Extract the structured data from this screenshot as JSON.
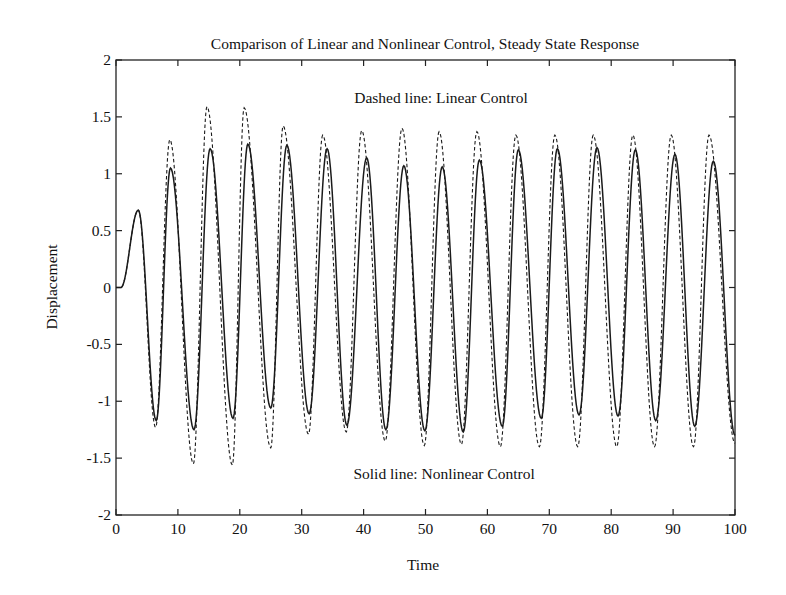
{
  "chart_data": {
    "type": "line",
    "title": "Comparison of Linear and Nonlinear Control, Steady State Response",
    "xlabel": "Time",
    "ylabel": "Displacement",
    "xlim": [
      0,
      100
    ],
    "ylim": [
      -2,
      2
    ],
    "xticks": [
      0,
      10,
      20,
      30,
      40,
      50,
      60,
      70,
      80,
      90,
      100
    ],
    "yticks": [
      -2,
      -1.5,
      -1,
      -0.5,
      0,
      0.5,
      1,
      1.5,
      2
    ],
    "ytick_labels": [
      "-2",
      "-1.5",
      "-1",
      "-0.5",
      "0",
      "0.5",
      "1",
      "1.5",
      "2"
    ],
    "grid": false,
    "annotations": [
      {
        "text": "Dashed line: Linear Control",
        "x": 52.5,
        "y": 1.62
      },
      {
        "text": "Solid line: Nonlinear Control",
        "x": 53,
        "y": -1.68
      }
    ],
    "series": [
      {
        "name": "Linear Control",
        "style": "dashed",
        "extrema": [
          [
            0,
            0
          ],
          [
            0.8,
            0
          ],
          [
            3.6,
            0.68
          ],
          [
            6.4,
            -1.23
          ],
          [
            8.7,
            1.3
          ],
          [
            12.5,
            -1.55
          ],
          [
            14.7,
            1.59
          ],
          [
            18.8,
            -1.56
          ],
          [
            20.7,
            1.58
          ],
          [
            25.0,
            -1.41
          ],
          [
            27.0,
            1.42
          ],
          [
            31.1,
            -1.29
          ],
          [
            33.4,
            1.34
          ],
          [
            37.2,
            -1.27
          ],
          [
            39.7,
            1.38
          ],
          [
            43.5,
            -1.35
          ],
          [
            46.2,
            1.4
          ],
          [
            49.8,
            -1.39
          ],
          [
            52.2,
            1.37
          ],
          [
            55.8,
            -1.38
          ],
          [
            58.3,
            1.37
          ],
          [
            62.1,
            -1.4
          ],
          [
            64.6,
            1.34
          ],
          [
            68.4,
            -1.4
          ],
          [
            70.9,
            1.34
          ],
          [
            74.6,
            -1.4
          ],
          [
            77.1,
            1.34
          ],
          [
            80.9,
            -1.4
          ],
          [
            83.5,
            1.34
          ],
          [
            87.0,
            -1.4
          ],
          [
            89.7,
            1.34
          ],
          [
            93.3,
            -1.4
          ],
          [
            95.8,
            1.34
          ],
          [
            100,
            -1.37
          ]
        ]
      },
      {
        "name": "Nonlinear Control",
        "style": "solid",
        "extrema": [
          [
            0,
            0
          ],
          [
            0.8,
            0
          ],
          [
            3.6,
            0.68
          ],
          [
            6.5,
            -1.17
          ],
          [
            8.8,
            1.05
          ],
          [
            12.6,
            -1.25
          ],
          [
            15.2,
            1.22
          ],
          [
            18.9,
            -1.15
          ],
          [
            21.3,
            1.26
          ],
          [
            25.0,
            -1.06
          ],
          [
            27.6,
            1.25
          ],
          [
            31.2,
            -1.11
          ],
          [
            34.1,
            1.22
          ],
          [
            37.3,
            -1.21
          ],
          [
            40.5,
            1.14
          ],
          [
            43.6,
            -1.25
          ],
          [
            46.5,
            1.07
          ],
          [
            49.9,
            -1.26
          ],
          [
            52.7,
            1.06
          ],
          [
            56.1,
            -1.27
          ],
          [
            58.7,
            1.12
          ],
          [
            62.4,
            -1.22
          ],
          [
            65.0,
            1.21
          ],
          [
            68.7,
            -1.15
          ],
          [
            71.3,
            1.22
          ],
          [
            74.8,
            -1.12
          ],
          [
            77.7,
            1.23
          ],
          [
            81.1,
            -1.13
          ],
          [
            83.9,
            1.21
          ],
          [
            87.2,
            -1.17
          ],
          [
            90.3,
            1.17
          ],
          [
            93.5,
            -1.22
          ],
          [
            96.5,
            1.11
          ],
          [
            100,
            -1.3
          ]
        ]
      }
    ]
  }
}
